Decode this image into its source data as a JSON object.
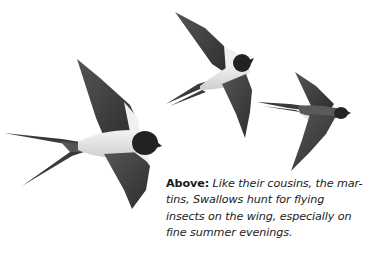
{
  "illustration": {
    "subject": "Three swallows in flight",
    "birds": [
      {
        "name": "swallow-large-left",
        "pose": "gliding, wings raised and lowered, long forked tail"
      },
      {
        "name": "swallow-top-middle",
        "pose": "banking, wings spread diagonally"
      },
      {
        "name": "swallow-right",
        "pose": "side view, wings swept"
      }
    ],
    "colors": {
      "wing": "#4a4a4a",
      "wing_dark": "#333333",
      "body_light": "#e6e6e6",
      "head": "#222222",
      "tail": "#3a3a3a"
    }
  },
  "caption": {
    "lead": "Above:",
    "lines": [
      "Like their cousins, the mar-",
      "tins, Swallows hunt for flying",
      "insects on the wing, especially on",
      "fine summer evenings."
    ]
  }
}
